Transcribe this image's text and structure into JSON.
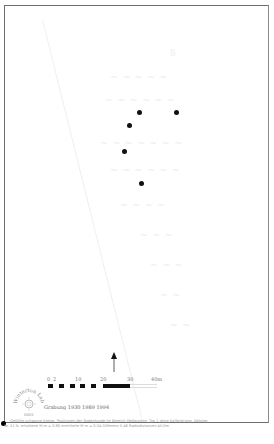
{
  "map": {
    "frame_color": "#6e6e6e",
    "dot_color": "#111111",
    "points": [
      {
        "id": "p1",
        "x": 139,
        "y": 112
      },
      {
        "id": "p2",
        "x": 176,
        "y": 112
      },
      {
        "id": "p3",
        "x": 129,
        "y": 125
      },
      {
        "id": "p4",
        "x": 124,
        "y": 151
      },
      {
        "id": "p5",
        "x": 141,
        "y": 183
      }
    ]
  },
  "north_arrow": {
    "icon": "north-arrow-icon"
  },
  "scale_bar": {
    "labels": [
      "0",
      "2",
      "10",
      "20",
      "30",
      "40m"
    ],
    "unit": "m"
  },
  "logo": {
    "text_top": "Winterton Lab",
    "text_bottom": "0001",
    "icon": "stamp-logo-icon"
  },
  "survey": {
    "label": "Grabung 1930 1989 1994"
  },
  "footer": {
    "line1": "Gefüllte schwarze Kreise: Positionen der Bodenfunde im Bereich Meßpunkte. Typ 1 ohne Kalibrierung. Abfolge",
    "line2": "Nr. 51  N. erhaltene M m = 0.80  ermittelte M m = 0.54  Differenz 0.46  Radiodistanzen 40.0m"
  }
}
